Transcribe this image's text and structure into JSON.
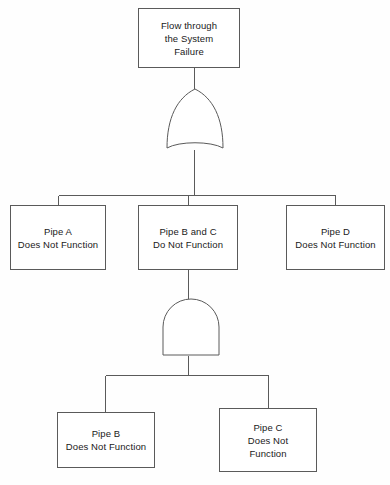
{
  "diagram": {
    "type": "fault-tree",
    "title_node": {
      "id": "top-event",
      "label": "Flow through\nthe System\nFailure"
    },
    "gates": [
      {
        "id": "or-gate-1",
        "kind": "OR",
        "icon": "or-gate-icon",
        "parent": "top-event",
        "children": [
          "pipe-a",
          "pipe-bc",
          "pipe-d"
        ]
      },
      {
        "id": "and-gate-1",
        "kind": "AND",
        "icon": "and-gate-icon",
        "parent": "pipe-bc",
        "children": [
          "pipe-b",
          "pipe-c"
        ]
      }
    ],
    "nodes": [
      {
        "id": "pipe-a",
        "label": "Pipe A\nDoes Not Function"
      },
      {
        "id": "pipe-bc",
        "label": "Pipe B and C\nDo Not Function"
      },
      {
        "id": "pipe-d",
        "label": "Pipe D\nDoes Not Function"
      },
      {
        "id": "pipe-b",
        "label": "Pipe B\nDoes Not Function"
      },
      {
        "id": "pipe-c",
        "label": "Pipe C\nDoes Not\nFunction"
      }
    ],
    "colors": {
      "line": "#5a5a5a",
      "text": "#1a1a1a",
      "background": "#fefefe",
      "box_fill": "#ffffff"
    }
  }
}
